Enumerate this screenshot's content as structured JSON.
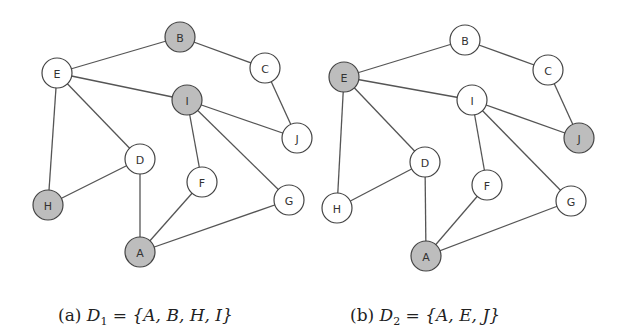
{
  "figures": [
    {
      "id": "a",
      "caption": {
        "prefix": "(a)",
        "set_name": "D",
        "set_subscript": "1",
        "equals": "=",
        "set_members": "{A, B, H, I}"
      },
      "highlighted": [
        "A",
        "B",
        "H",
        "I"
      ],
      "nodes": [
        {
          "id": "A",
          "x": 140,
          "y": 252
        },
        {
          "id": "B",
          "x": 180,
          "y": 37
        },
        {
          "id": "C",
          "x": 265,
          "y": 68
        },
        {
          "id": "D",
          "x": 140,
          "y": 159
        },
        {
          "id": "E",
          "x": 57,
          "y": 73
        },
        {
          "id": "F",
          "x": 202,
          "y": 182
        },
        {
          "id": "G",
          "x": 289,
          "y": 200
        },
        {
          "id": "H",
          "x": 48,
          "y": 205
        },
        {
          "id": "I",
          "x": 187,
          "y": 100
        },
        {
          "id": "J",
          "x": 297,
          "y": 138
        }
      ]
    },
    {
      "id": "b",
      "caption": {
        "prefix": "(b)",
        "set_name": "D",
        "set_subscript": "2",
        "equals": "=",
        "set_members": "{A, E, J}"
      },
      "highlighted": [
        "A",
        "E",
        "J"
      ],
      "nodes": [
        {
          "id": "A",
          "x": 426,
          "y": 256
        },
        {
          "id": "B",
          "x": 465,
          "y": 40
        },
        {
          "id": "C",
          "x": 548,
          "y": 70
        },
        {
          "id": "D",
          "x": 425,
          "y": 162
        },
        {
          "id": "E",
          "x": 344,
          "y": 77
        },
        {
          "id": "F",
          "x": 487,
          "y": 185
        },
        {
          "id": "G",
          "x": 571,
          "y": 201
        },
        {
          "id": "H",
          "x": 337,
          "y": 208
        },
        {
          "id": "I",
          "x": 472,
          "y": 100
        },
        {
          "id": "J",
          "x": 579,
          "y": 138
        }
      ]
    }
  ],
  "edges": [
    [
      "E",
      "B"
    ],
    [
      "B",
      "C"
    ],
    [
      "C",
      "J"
    ],
    [
      "E",
      "I"
    ],
    [
      "E",
      "D"
    ],
    [
      "E",
      "H"
    ],
    [
      "I",
      "J"
    ],
    [
      "I",
      "F"
    ],
    [
      "I",
      "G"
    ],
    [
      "D",
      "H"
    ],
    [
      "D",
      "A"
    ],
    [
      "F",
      "A"
    ],
    [
      "G",
      "A"
    ]
  ],
  "style": {
    "node_radius": 15,
    "highlight_fill": "#bdbdbd",
    "normal_fill": "#ffffff"
  }
}
